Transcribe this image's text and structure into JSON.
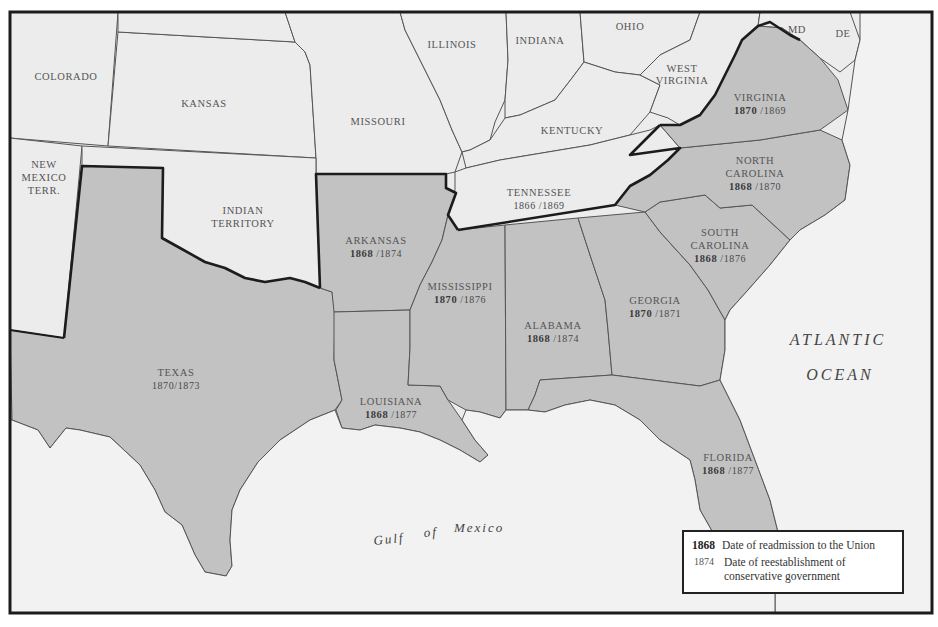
{
  "map": {
    "title": "Reconstruction in the South",
    "colors": {
      "background": "#ffffff",
      "paper": "#ececec",
      "confederate_fill": "#c2c2c2",
      "other_fill": "#ececec",
      "border": "#1c1c1c",
      "thin_border": "#555555"
    },
    "states": {
      "colorado": {
        "name": "COLORADO"
      },
      "kansas": {
        "name": "KANSAS"
      },
      "missouri": {
        "name": "MISSOURI"
      },
      "illinois": {
        "name": "ILLINOIS"
      },
      "indiana": {
        "name": "INDIANA"
      },
      "ohio": {
        "name": "OHIO"
      },
      "kentucky": {
        "name": "KENTUCKY"
      },
      "west_virginia": {
        "name_line1": "WEST",
        "name_line2": "VIRGINIA"
      },
      "maryland": {
        "name": "MD"
      },
      "delaware": {
        "name": "DE"
      },
      "new_mexico": {
        "name_line1": "NEW",
        "name_line2": "MEXICO",
        "name_line3": "TERR."
      },
      "indian_territory": {
        "name_line1": "INDIAN",
        "name_line2": "TERRITORY"
      },
      "texas": {
        "name": "TEXAS",
        "dates": "1870/1873"
      },
      "arkansas": {
        "name": "ARKANSAS",
        "readmission": "1868",
        "conservative": "/1874"
      },
      "tennessee": {
        "name": "TENNESSEE",
        "readmission": "1866",
        "conservative": "/1869"
      },
      "mississippi": {
        "name": "MISSISSIPPI",
        "readmission": "1870",
        "conservative": "/1876"
      },
      "alabama": {
        "name": "ALABAMA",
        "readmission": "1868",
        "conservative": "/1874"
      },
      "georgia": {
        "name": "GEORGIA",
        "readmission": "1870",
        "conservative": "/1871"
      },
      "louisiana": {
        "name": "LOUISIANA",
        "readmission": "1868",
        "conservative": "/1877"
      },
      "florida": {
        "name": "FLORIDA",
        "readmission": "1868",
        "conservative": "/1877"
      },
      "south_carolina": {
        "name_line1": "SOUTH",
        "name_line2": "CAROLINA",
        "readmission": "1868",
        "conservative": "/1876"
      },
      "north_carolina": {
        "name_line1": "NORTH",
        "name_line2": "CAROLINA",
        "readmission": "1868",
        "conservative": "/1870"
      },
      "virginia": {
        "name": "VIRGINIA",
        "readmission": "1870",
        "conservative": "/1869"
      }
    },
    "water": {
      "atlantic_line1": "ATLANTIC",
      "atlantic_line2": "OCEAN",
      "gulf_word1": "Gulf",
      "gulf_word2": "of",
      "gulf_word3": "Mexico"
    }
  },
  "legend": {
    "items": [
      {
        "key": "1868",
        "description": "Date of readmission to the Union"
      },
      {
        "key": "1874",
        "description": "Date of reestablishment of conservative government"
      }
    ]
  }
}
